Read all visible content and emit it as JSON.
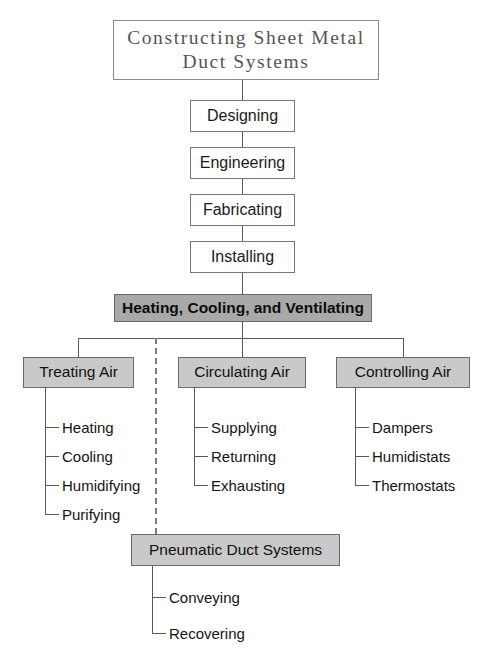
{
  "diagram": {
    "type": "flowchart",
    "title_box": {
      "line1": "Constructing  Sheet  Metal",
      "line2": "Duct  Systems"
    },
    "process_steps": [
      {
        "label": "Designing"
      },
      {
        "label": "Engineering"
      },
      {
        "label": "Fabricating"
      },
      {
        "label": "Installing"
      }
    ],
    "highlight_bar": {
      "label": "Heating, Cooling, and Ventilating"
    },
    "categories": [
      {
        "label": "Treating Air",
        "items": [
          "Heating",
          "Cooling",
          "Humidifying",
          "Purifying"
        ]
      },
      {
        "label": "Circulating Air",
        "items": [
          "Supplying",
          "Returning",
          "Exhausting"
        ]
      },
      {
        "label": "Controlling Air",
        "items": [
          "Dampers",
          "Humidistats",
          "Thermostats"
        ]
      }
    ],
    "secondary": {
      "label": "Pneumatic Duct Systems",
      "items": [
        "Conveying",
        "Recovering"
      ]
    },
    "colors": {
      "highlight_fill": "#a9a9a9",
      "category_fill": "#c9c9c9",
      "box_fill": "#ffffff",
      "line": "#5a5a5a",
      "dashed_line": "#7a7a7a",
      "text": "#141414",
      "title_text": "#555555"
    }
  }
}
